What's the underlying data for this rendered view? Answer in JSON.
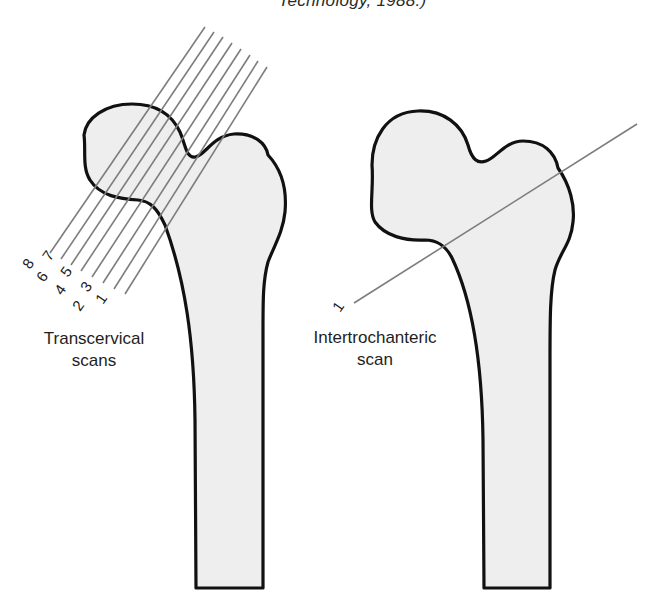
{
  "caption_fragment": "Technology, 1988.)",
  "figure": {
    "left_panel": {
      "label_line1": "Transcervical",
      "label_line2": "scans",
      "scan_numbers": [
        "1",
        "2",
        "3",
        "4",
        "5",
        "6",
        "7",
        "8"
      ]
    },
    "right_panel": {
      "label_line1": "Intertrochanteric",
      "label_line2": "scan",
      "scan_numbers": [
        "1"
      ]
    }
  },
  "colors": {
    "bone_fill": "#eeeeee",
    "bone_outline": "#111111",
    "scan_line": "#7d7d7d",
    "text": "#1e1e1e"
  }
}
